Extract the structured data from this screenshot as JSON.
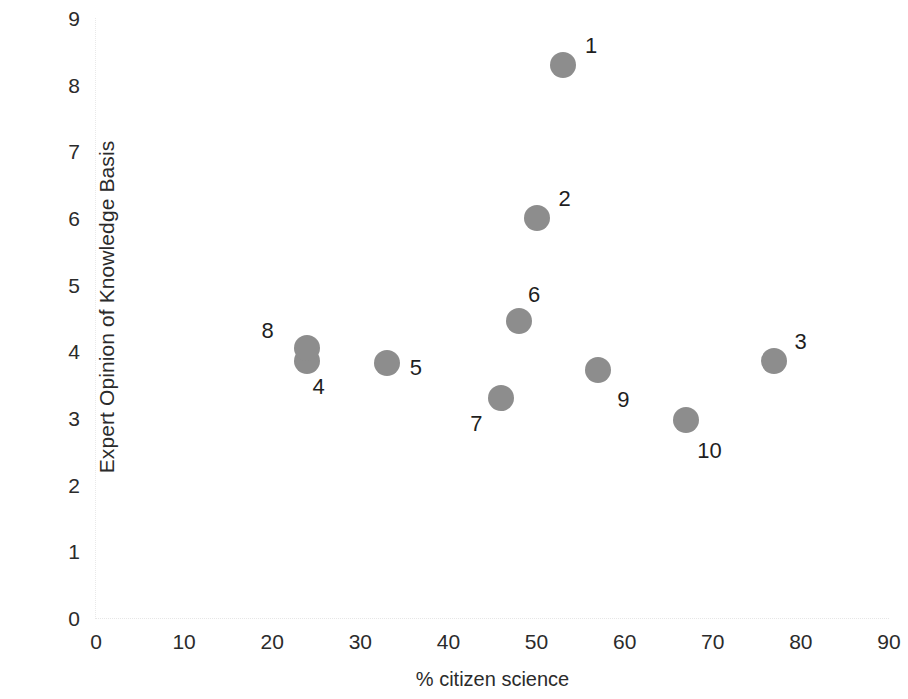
{
  "chart_data": {
    "type": "scatter",
    "title": "",
    "xlabel": "% citizen science",
    "ylabel": "Expert Opinion of Knowledge Basis",
    "xlim": [
      0,
      90
    ],
    "ylim": [
      0,
      9
    ],
    "xticks": [
      "0",
      "10",
      "20",
      "30",
      "40",
      "50",
      "60",
      "70",
      "80",
      "90"
    ],
    "yticks": [
      "0",
      "1",
      "2",
      "3",
      "4",
      "5",
      "6",
      "7",
      "8",
      "9"
    ],
    "grid": false,
    "legend": "none",
    "marker_color": "#8d8d8d",
    "points": [
      {
        "label": "1",
        "x": 53,
        "y": 8.3,
        "label_dx": 22,
        "label_dy": -22
      },
      {
        "label": "2",
        "x": 50,
        "y": 6.0,
        "label_dx": 22,
        "label_dy": -22
      },
      {
        "label": "3",
        "x": 77,
        "y": 3.85,
        "label_dx": 20,
        "label_dy": -22
      },
      {
        "label": "4",
        "x": 24,
        "y": 3.85,
        "label_dx": 5,
        "label_dy": 23
      },
      {
        "label": "5",
        "x": 33,
        "y": 3.82,
        "label_dx": 23,
        "label_dy": 2
      },
      {
        "label": "6",
        "x": 48,
        "y": 4.45,
        "label_dx": 9,
        "label_dy": -29
      },
      {
        "label": "7",
        "x": 46,
        "y": 3.3,
        "label_dx": -31,
        "label_dy": 23
      },
      {
        "label": "8",
        "x": 24,
        "y": 4.05,
        "label_dx": -46,
        "label_dy": -20
      },
      {
        "label": "9",
        "x": 57,
        "y": 3.72,
        "label_dx": 19,
        "label_dy": 27
      },
      {
        "label": "10",
        "x": 67,
        "y": 2.97,
        "label_dx": 11,
        "label_dy": 28
      }
    ]
  }
}
